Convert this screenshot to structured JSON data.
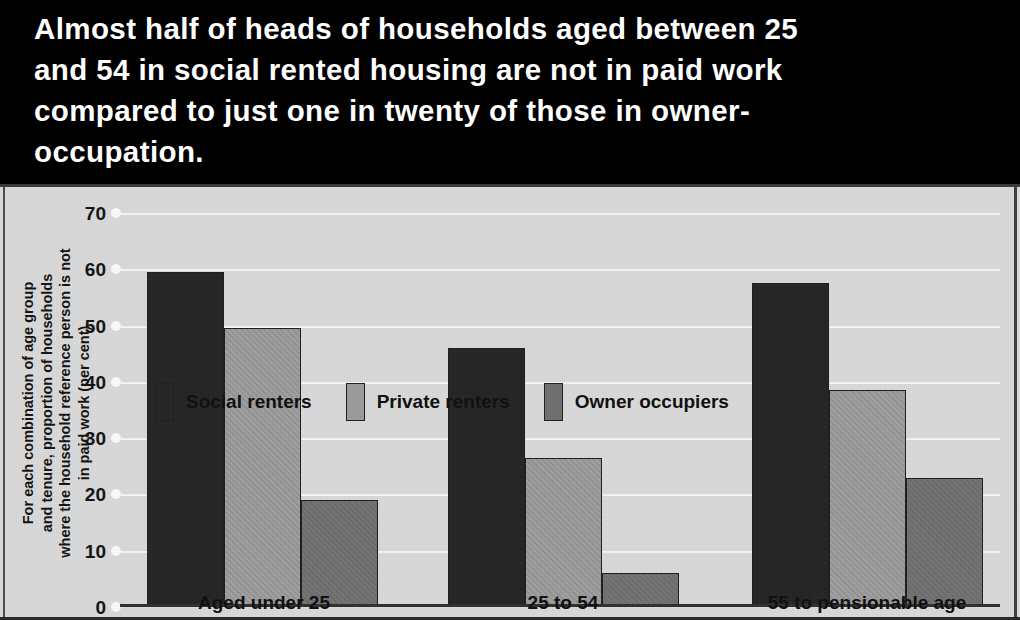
{
  "headline": {
    "lines": [
      "Almost half of heads of households aged between 25",
      "and 54 in social rented housing are not in paid work",
      "compared to just one in twenty of those in owner-",
      "occupation."
    ]
  },
  "chart_data": {
    "type": "bar",
    "title": "",
    "xlabel": "",
    "ylabel_lines": [
      "For each combination of age group",
      "and tenure, proportion of households",
      "where the household reference person is not",
      "in paid work (per cent)"
    ],
    "ylabel": "For each combination of age group and tenure, proportion of households where the household reference person is not in paid work (per cent)",
    "categories": [
      "Aged under 25",
      "25 to 54",
      "55 to pensionable age"
    ],
    "series": [
      {
        "name": "Social renters",
        "color": "#242424",
        "values": [
          59.5,
          46,
          57.5
        ]
      },
      {
        "name": "Private renters",
        "color": "#9b9b9b",
        "values": [
          49.5,
          26.5,
          38.5
        ]
      },
      {
        "name": "Owner occupiers",
        "color": "#6f6f6f",
        "values": [
          19,
          6,
          23
        ]
      }
    ],
    "ylim": [
      0,
      70
    ],
    "yticks": [
      0,
      10,
      20,
      30,
      40,
      50,
      60,
      70
    ],
    "ytick_labels": [
      "0",
      "10",
      "20",
      "30",
      "40",
      "50",
      "60",
      "70"
    ],
    "grid": true,
    "legend_position": "top-left-inside",
    "background_color": "#d9d9d9",
    "headline_background": "#000000",
    "headline_text_color": "#ffffff"
  }
}
